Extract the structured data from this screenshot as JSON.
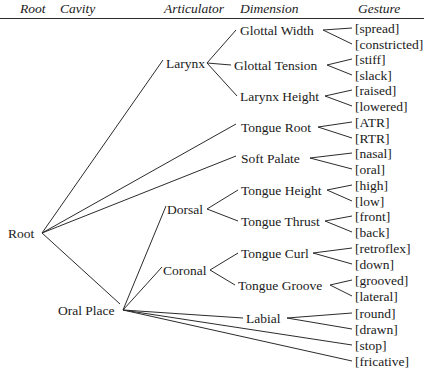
{
  "diagram": {
    "type": "tree",
    "headers": [
      {
        "label": "Root",
        "x": 20
      },
      {
        "label": "Cavity",
        "x": 60
      },
      {
        "label": "Articulator",
        "x": 164
      },
      {
        "label": "Dimension",
        "x": 240
      },
      {
        "label": "Gesture",
        "x": 358
      }
    ],
    "nodes": {
      "root": {
        "label": "Root",
        "x": 8,
        "y": 233,
        "anchor_x": 42,
        "text_anchor": "start"
      },
      "oral_place": {
        "label": "Oral Place",
        "x": 58,
        "y": 310,
        "anchor_x": 123,
        "text_anchor": "start"
      },
      "larynx": {
        "label": "Larynx",
        "x": 166,
        "y": 63,
        "anchor_x": 207,
        "text_anchor": "start"
      },
      "dorsal": {
        "label": "Dorsal",
        "x": 167,
        "y": 209,
        "anchor_x": 207,
        "text_anchor": "start"
      },
      "coronal": {
        "label": "Coronal",
        "x": 163,
        "y": 270,
        "anchor_x": 210,
        "text_anchor": "start"
      }
    },
    "dimensions": [
      {
        "id": "glottal_width",
        "label": "Glottal Width",
        "x": 240,
        "y": 30,
        "right": 323,
        "left": 236
      },
      {
        "id": "glottal_tension",
        "label": "Glottal Tension",
        "x": 234,
        "y": 65,
        "right": 327,
        "left": 231
      },
      {
        "id": "larynx_height",
        "label": "Larynx Height",
        "x": 240,
        "y": 96,
        "right": 325,
        "left": 237
      },
      {
        "id": "tongue_root",
        "label": "Tongue Root",
        "x": 241,
        "y": 127,
        "right": 318,
        "left": 238
      },
      {
        "id": "soft_palate",
        "label": "Soft Palate",
        "x": 241,
        "y": 158,
        "right": 310,
        "left": 238
      },
      {
        "id": "tongue_height",
        "label": "Tongue Height",
        "x": 241,
        "y": 190,
        "right": 327,
        "left": 238
      },
      {
        "id": "tongue_thrust",
        "label": "Tongue Thrust",
        "x": 241,
        "y": 221,
        "right": 325,
        "left": 238
      },
      {
        "id": "tongue_curl",
        "label": "Tongue Curl",
        "x": 241,
        "y": 253,
        "right": 313,
        "left": 238
      },
      {
        "id": "tongue_groove",
        "label": "Tongue Groove",
        "x": 238,
        "y": 285,
        "right": 330,
        "left": 235
      },
      {
        "id": "labial",
        "label": "Labial",
        "x": 246,
        "y": 318,
        "right": 287,
        "left": 243
      }
    ],
    "gestures": [
      {
        "label": "[spread]",
        "y": 28,
        "fork": "glottal_width"
      },
      {
        "label": "[constricted]",
        "y": 44,
        "fork": "glottal_width"
      },
      {
        "label": "[stiff]",
        "y": 59,
        "fork": "glottal_tension"
      },
      {
        "label": "[slack]",
        "y": 75,
        "fork": "glottal_tension"
      },
      {
        "label": "[raised]",
        "y": 90,
        "fork": "larynx_height"
      },
      {
        "label": "[lowered]",
        "y": 106,
        "fork": "larynx_height"
      },
      {
        "label": "[ATR]",
        "y": 122,
        "fork": "tongue_root"
      },
      {
        "label": "[RTR]",
        "y": 138,
        "fork": "tongue_root"
      },
      {
        "label": "[nasal]",
        "y": 153,
        "fork": "soft_palate"
      },
      {
        "label": "[oral]",
        "y": 169,
        "fork": "soft_palate"
      },
      {
        "label": "[high]",
        "y": 185,
        "fork": "tongue_height"
      },
      {
        "label": "[low]",
        "y": 201,
        "fork": "tongue_height"
      },
      {
        "label": "[front]",
        "y": 216,
        "fork": "tongue_thrust"
      },
      {
        "label": "[back]",
        "y": 232,
        "fork": "tongue_thrust"
      },
      {
        "label": "[retroflex]",
        "y": 248,
        "fork": "tongue_curl"
      },
      {
        "label": "[down]",
        "y": 264,
        "fork": "tongue_curl"
      },
      {
        "label": "[grooved]",
        "y": 280,
        "fork": "tongue_groove"
      },
      {
        "label": "[lateral]",
        "y": 296,
        "fork": "tongue_groove"
      },
      {
        "label": "[round]",
        "y": 313,
        "fork": "labial"
      },
      {
        "label": "[drawn]",
        "y": 329,
        "fork": "labial"
      },
      {
        "label": "[stop]",
        "y": 345,
        "fork": "oral_place_direct"
      },
      {
        "label": "[fricative]",
        "y": 361,
        "fork": "oral_place_direct"
      }
    ],
    "gesture_x": 355,
    "edges": [
      {
        "from": "root",
        "to": "larynx",
        "x1": 42,
        "y1": 233,
        "x2": 163,
        "y2": 60
      },
      {
        "from": "root",
        "to": "tongue_root",
        "x1": 42,
        "y1": 233,
        "x2": 236,
        "y2": 124
      },
      {
        "from": "root",
        "to": "soft_palate",
        "x1": 42,
        "y1": 233,
        "x2": 236,
        "y2": 156
      },
      {
        "from": "root",
        "to": "oral_place",
        "x1": 42,
        "y1": 233,
        "x2": 120,
        "y2": 304
      },
      {
        "from": "larynx",
        "to": "glottal_width",
        "x1": 207,
        "y1": 63,
        "x2": 236,
        "y2": 30
      },
      {
        "from": "larynx",
        "to": "glottal_tension",
        "x1": 207,
        "y1": 63,
        "x2": 231,
        "y2": 65
      },
      {
        "from": "larynx",
        "to": "larynx_height",
        "x1": 207,
        "y1": 63,
        "x2": 237,
        "y2": 96
      },
      {
        "from": "oral_place",
        "to": "dorsal",
        "x1": 123,
        "y1": 310,
        "x2": 166,
        "y2": 206
      },
      {
        "from": "oral_place",
        "to": "coronal",
        "x1": 123,
        "y1": 310,
        "x2": 162,
        "y2": 267
      },
      {
        "from": "oral_place",
        "to": "labial",
        "x1": 123,
        "y1": 310,
        "x2": 243,
        "y2": 318
      },
      {
        "from": "oral_place",
        "to": "stop",
        "x1": 123,
        "y1": 310,
        "x2": 352,
        "y2": 345
      },
      {
        "from": "oral_place",
        "to": "fricative",
        "x1": 123,
        "y1": 310,
        "x2": 352,
        "y2": 361
      },
      {
        "from": "dorsal",
        "to": "tongue_height",
        "x1": 207,
        "y1": 209,
        "x2": 238,
        "y2": 190
      },
      {
        "from": "dorsal",
        "to": "tongue_thrust",
        "x1": 207,
        "y1": 209,
        "x2": 238,
        "y2": 221
      },
      {
        "from": "coronal",
        "to": "tongue_curl",
        "x1": 210,
        "y1": 270,
        "x2": 238,
        "y2": 253
      },
      {
        "from": "coronal",
        "to": "tongue_groove",
        "x1": 210,
        "y1": 270,
        "x2": 235,
        "y2": 285
      }
    ],
    "colors": {
      "line": "#2b2b2b",
      "text": "#1a1a1a",
      "background": "#ffffff"
    }
  }
}
